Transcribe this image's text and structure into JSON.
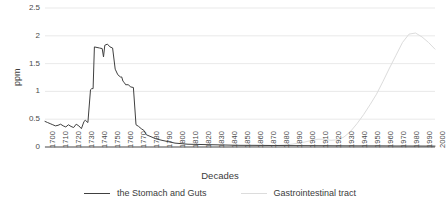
{
  "chart_data": {
    "type": "line",
    "title": "",
    "xlabel": "Decades",
    "ylabel": "ppm",
    "xlim": [
      1700,
      2000
    ],
    "ylim": [
      0,
      2.5
    ],
    "grid": true,
    "legend_position": "bottom",
    "yticks": [
      "2.5",
      "2",
      "1.5",
      "1",
      "0.5",
      "0"
    ],
    "ytick_values": [
      2.5,
      2,
      1.5,
      1,
      0.5,
      0
    ],
    "categories": [
      1700,
      1710,
      1720,
      1730,
      1740,
      1750,
      1760,
      1770,
      1780,
      1790,
      1800,
      1810,
      1820,
      1830,
      1840,
      1850,
      1860,
      1870,
      1880,
      1890,
      1900,
      1910,
      1920,
      1930,
      1940,
      1950,
      1960,
      1970,
      1980,
      1990,
      2000
    ],
    "xtick_labels": [
      "1700",
      "1710",
      "1720",
      "1730",
      "1740",
      "1750",
      "1760",
      "1770",
      "1780",
      "1790",
      "1800",
      "1810",
      "1820",
      "1830",
      "1840",
      "1850",
      "1860",
      "1870",
      "1880",
      "1890",
      "1900",
      "1910",
      "1920",
      "1930",
      "1940",
      "1950",
      "1960",
      "1970",
      "1980",
      "1990",
      "2000"
    ],
    "series": [
      {
        "name": "the Stomach and Guts",
        "color": "#404040",
        "x": [
          1700,
          1702,
          1704,
          1706,
          1708,
          1710,
          1712,
          1714,
          1716,
          1718,
          1720,
          1722,
          1724,
          1726,
          1728,
          1730,
          1731,
          1733,
          1735,
          1736,
          1737,
          1738,
          1740,
          1742,
          1744,
          1745,
          1746,
          1748,
          1750,
          1752,
          1754,
          1756,
          1758,
          1759,
          1760,
          1761,
          1762,
          1764,
          1766,
          1768,
          1770,
          1772,
          1774,
          1776,
          1778,
          1780,
          1785,
          1790,
          1800,
          1810,
          1820,
          1830,
          1840,
          1850,
          1860,
          1870,
          1880,
          1890,
          1900,
          1910,
          1920,
          1930,
          1940,
          1950,
          1960,
          1970,
          1980,
          1990,
          2000
        ],
        "values": [
          0.46,
          0.44,
          0.42,
          0.4,
          0.38,
          0.39,
          0.41,
          0.38,
          0.36,
          0.4,
          0.37,
          0.35,
          0.41,
          0.38,
          0.33,
          0.46,
          0.48,
          0.44,
          1.03,
          1.05,
          1.05,
          1.8,
          1.79,
          1.78,
          1.77,
          1.62,
          1.83,
          1.85,
          1.8,
          1.78,
          1.4,
          1.3,
          1.26,
          1.26,
          1.18,
          1.16,
          1.12,
          1.12,
          1.08,
          1.07,
          0.4,
          0.37,
          0.33,
          0.3,
          0.22,
          0.2,
          0.15,
          0.12,
          0.07,
          0.05,
          0.045,
          0.04,
          0.035,
          0.03,
          0.03,
          0.028,
          0.026,
          0.025,
          0.024,
          0.023,
          0.022,
          0.021,
          0.02,
          0.02,
          0.02,
          0.018,
          0.018,
          0.017,
          0.016
        ]
      },
      {
        "name": "Gastrointestinal tract",
        "color": "#dcdcdc",
        "x": [
          1700,
          1750,
          1800,
          1840,
          1860,
          1870,
          1880,
          1890,
          1900,
          1905,
          1910,
          1915,
          1920,
          1925,
          1930,
          1935,
          1940,
          1945,
          1950,
          1955,
          1960,
          1965,
          1970,
          1975,
          1980,
          1985,
          1990,
          1995,
          2000
        ],
        "values": [
          0.0,
          0.0,
          0.0,
          0.0,
          0.01,
          0.02,
          0.03,
          0.05,
          0.09,
          0.12,
          0.14,
          0.14,
          0.12,
          0.13,
          0.18,
          0.28,
          0.42,
          0.58,
          0.76,
          0.95,
          1.18,
          1.42,
          1.65,
          1.88,
          2.03,
          2.05,
          1.98,
          1.88,
          1.76
        ]
      }
    ]
  },
  "legend": {
    "items": [
      {
        "label": "the Stomach and Guts",
        "color": "#404040"
      },
      {
        "label": "Gastrointestinal tract",
        "color": "#dcdcdc"
      }
    ]
  }
}
